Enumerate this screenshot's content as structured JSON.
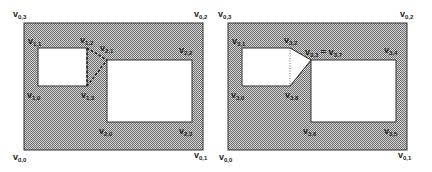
{
  "colors": {
    "hatch_fg": "#6e6e6e",
    "hatch_bg": "#d4d4d4",
    "hole_fill": "#ffffff",
    "stroke": "#333333",
    "text": "#222222"
  },
  "panels": [
    {
      "id": "left",
      "outer_labels": {
        "v03": {
          "base": "v",
          "sub": "0,3"
        },
        "v02": {
          "base": "v",
          "sub": "0,2"
        },
        "v00": {
          "base": "v",
          "sub": "0,0"
        },
        "v01": {
          "base": "v",
          "sub": "0,1"
        }
      },
      "inner_labels": {
        "v11": {
          "base": "v",
          "sub": "1,1"
        },
        "v12": {
          "base": "v",
          "sub": "1,2"
        },
        "v21": {
          "base": "v",
          "sub": "2,1"
        },
        "v22": {
          "base": "v",
          "sub": "2,2"
        },
        "v10": {
          "base": "v",
          "sub": "1,0"
        },
        "v13": {
          "base": "v",
          "sub": "1,3"
        },
        "v20": {
          "base": "v",
          "sub": "2,0"
        },
        "v23": {
          "base": "v",
          "sub": "2,3"
        }
      }
    },
    {
      "id": "right",
      "outer_labels": {
        "v03": {
          "base": "v",
          "sub": "0,3"
        },
        "v02": {
          "base": "v",
          "sub": "0,2"
        },
        "v00": {
          "base": "v",
          "sub": "0,0"
        },
        "v01": {
          "base": "v",
          "sub": "0,1"
        }
      },
      "inner_labels": {
        "v31": {
          "base": "v",
          "sub": "3,1"
        },
        "v32": {
          "base": "v",
          "sub": "3,2"
        },
        "v33": {
          "base": "v",
          "sub": "3,3",
          "suffix": " = v",
          "suffix_sub": "3,7"
        },
        "v34": {
          "base": "v",
          "sub": "3,4"
        },
        "v30": {
          "base": "v",
          "sub": "3,0"
        },
        "v38": {
          "base": "v",
          "sub": "3,8"
        },
        "v36": {
          "base": "v",
          "sub": "3,6"
        },
        "v35": {
          "base": "v",
          "sub": "3,5"
        }
      }
    }
  ]
}
